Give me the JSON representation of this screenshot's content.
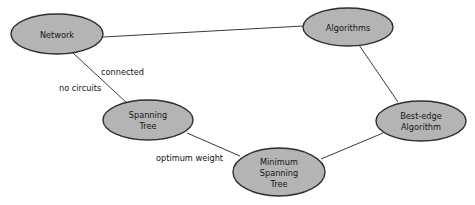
{
  "diagram": {
    "type": "concept-graph",
    "background_color": "#ffffff",
    "node_fill_color": "#b4b4b4",
    "node_border_color": "#2e2e2e",
    "edge_color": "#3a3a3a",
    "text_color": "#141414",
    "nodes": [
      {
        "id": "network",
        "label": "Network",
        "lines": [
          "Network"
        ],
        "cx": 57,
        "cy": 34,
        "rx": 46,
        "ry": 20
      },
      {
        "id": "algorithms",
        "label": "Algorithms",
        "lines": [
          "Algorithms"
        ],
        "cx": 348,
        "cy": 27,
        "rx": 45,
        "ry": 19
      },
      {
        "id": "spanning-tree",
        "label": "Spanning Tree",
        "lines": [
          "Spanning",
          "Tree"
        ],
        "cx": 148,
        "cy": 120,
        "rx": 45,
        "ry": 20
      },
      {
        "id": "best-edge-algorithm",
        "label": "Best-edge Algorithm",
        "lines": [
          "Best-edge",
          "Algorithm"
        ],
        "cx": 421,
        "cy": 121,
        "rx": 45,
        "ry": 20
      },
      {
        "id": "minimum-spanning-tree",
        "label": "Minimum Spanning Tree",
        "lines": [
          "Minimum",
          "Spanning",
          "Tree"
        ],
        "cx": 279,
        "cy": 172,
        "rx": 46,
        "ry": 24
      }
    ],
    "edges": [
      {
        "id": "network-algorithms",
        "from": "network",
        "to": "algorithms",
        "x1": 103,
        "y1": 37,
        "x2": 303,
        "y2": 26,
        "label": ""
      },
      {
        "id": "network-spanning-tree",
        "from": "network",
        "to": "spanning-tree",
        "x1": 73,
        "y1": 53,
        "x2": 128,
        "y2": 104,
        "label": "connected / no circuits"
      },
      {
        "id": "spanning-tree-minimum-spanning-tree",
        "from": "spanning-tree",
        "to": "minimum-spanning-tree",
        "x1": 187,
        "y1": 133,
        "x2": 240,
        "y2": 156,
        "label": "optimum weight"
      },
      {
        "id": "minimum-spanning-tree-best-edge",
        "from": "minimum-spanning-tree",
        "to": "best-edge-algorithm",
        "x1": 321,
        "y1": 159,
        "x2": 383,
        "y2": 133,
        "label": ""
      },
      {
        "id": "algorithms-best-edge",
        "from": "algorithms",
        "to": "best-edge-algorithm",
        "x1": 359,
        "y1": 45,
        "x2": 398,
        "y2": 102,
        "label": ""
      }
    ],
    "edge_labels": [
      {
        "id": "connected",
        "text": "connected",
        "x": 101,
        "y": 72,
        "for_edge": "network-spanning-tree"
      },
      {
        "id": "no-circuits",
        "text": "no circuits",
        "x": 59,
        "y": 88,
        "for_edge": "network-spanning-tree"
      },
      {
        "id": "optimum-weight",
        "text": "optimum weight",
        "x": 156,
        "y": 158,
        "for_edge": "spanning-tree-minimum-spanning-tree"
      }
    ]
  }
}
